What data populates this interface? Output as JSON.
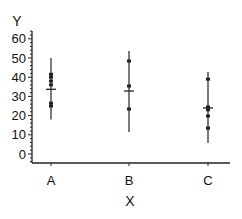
{
  "chart_data": {
    "type": "scatter",
    "subtype": "dot-plot-with-range-and-mean",
    "title": "",
    "xlabel": "X",
    "ylabel": "Y",
    "categories": [
      "A",
      "B",
      "C"
    ],
    "ylim": [
      -5,
      65
    ],
    "yticks": [
      0,
      10,
      20,
      30,
      40,
      50,
      60
    ],
    "grid": false,
    "legend": null,
    "groups": [
      {
        "name": "A",
        "points": [
          41.5,
          40,
          38,
          36,
          26.5,
          25
        ],
        "mean": 33.7,
        "range": [
          18,
          50
        ]
      },
      {
        "name": "B",
        "points": [
          48.4,
          35.4,
          23.4
        ],
        "mean": 32.8,
        "range": [
          11.5,
          53.6
        ]
      },
      {
        "name": "C",
        "points": [
          39,
          24.5,
          23,
          19.8,
          13.5
        ],
        "mean": 24,
        "range": [
          5.7,
          42.7
        ]
      }
    ]
  },
  "axis": {
    "y_title": "Y",
    "x_title": "X",
    "y_tick_labels": [
      "0",
      "10",
      "20",
      "30",
      "40",
      "50",
      "60"
    ],
    "x_tick_labels": [
      "A",
      "B",
      "C"
    ]
  },
  "colors": {
    "line": "#222222",
    "text": "#111111",
    "background": "#ffffff"
  }
}
